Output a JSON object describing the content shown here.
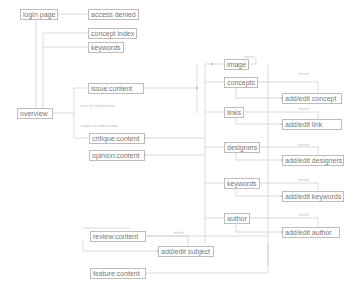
{
  "nodes": {
    "login_page": "login page",
    "access_denied": "access denied",
    "concept_index": "concept index",
    "keywords_top": "keywords",
    "overview": "overview",
    "issue_content": "issue:content",
    "critique_content": "critique:content",
    "opinion_content": "opinion:content",
    "image": "image",
    "concepts": "concepts",
    "add_edit_concept": "add/edit concept",
    "links": "links",
    "add_edit_link": "add/edit link",
    "designers": "designers",
    "add_edit_designers": "add/edit designers",
    "keywords": "keywords",
    "add_edit_keywords": "add/edit keywords",
    "author": "author",
    "add_edit_author": "add/edit author",
    "review_content": "review:content",
    "add_edit_subject": "add/edit subject",
    "feature_content": "feature:content"
  },
  "edge_labels": {
    "issue_added": "issue list added button",
    "critique_added": "critique list added button",
    "refresh": "refresh"
  }
}
